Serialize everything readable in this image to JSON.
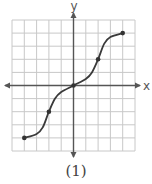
{
  "chart_data": {
    "type": "line",
    "title": "",
    "caption": "(1)",
    "xlabel": "x",
    "ylabel": "y",
    "xlim": [
      -5,
      5
    ],
    "ylim": [
      -5,
      5
    ],
    "grid": true,
    "grid_step": 1,
    "axis_arrows": true,
    "tick_labels": false,
    "marked_points": [
      {
        "x": -4,
        "y": -4
      },
      {
        "x": -2,
        "y": -2
      },
      {
        "x": 0,
        "y": 0
      },
      {
        "x": 2,
        "y": 2
      },
      {
        "x": 4,
        "y": 4
      }
    ],
    "curve_description": "S-shaped increasing curve: flat near y=-4 at left end, steep through (-2,-2), flattening through origin, steep through (2,2), flattening near y=4 at right end",
    "series": [
      {
        "name": "f(x)",
        "x": [
          -4,
          -3,
          -2.5,
          -2,
          -1.5,
          -1,
          0,
          1,
          1.5,
          2,
          2.5,
          3,
          4
        ],
        "y": [
          -4,
          -3.7,
          -3.2,
          -2,
          -1.0,
          -0.5,
          0,
          0.5,
          1.0,
          2,
          3.2,
          3.7,
          4
        ]
      }
    ]
  },
  "labels": {
    "x_axis": "x",
    "y_axis": "y",
    "caption": "(1)"
  },
  "colors": {
    "grid": "#c8c8c8",
    "axis": "#555555",
    "curve": "#3a3a3a",
    "point": "#333333"
  }
}
